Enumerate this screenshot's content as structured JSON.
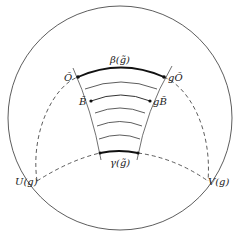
{
  "diagram": {
    "type": "hyperbolic-disk-figure",
    "colors": {
      "stroke": "#333333",
      "background": "#ffffff"
    },
    "labels": {
      "O_tilde": "Õ",
      "gO_tilde": "gÕ",
      "B_tilde": "B̃",
      "gB_tilde": "gB̃",
      "beta": "β(g̃)",
      "gamma": "γ(g̃)",
      "U": "U(g)",
      "V": "V(g)"
    },
    "elements": {
      "outer_circle": "boundary circle",
      "dashed_arcs": [
        "upper dashed geodesic through Õ and gÕ",
        "lower dashed geodesic from U(g) to V(g)"
      ],
      "rungs": 5,
      "bold_arcs": [
        "β(g̃)",
        "γ(g̃)"
      ]
    }
  }
}
